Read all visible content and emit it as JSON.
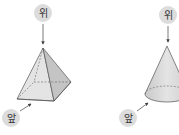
{
  "figures": [
    {
      "name": "square-pyramid",
      "top_label": "위",
      "front_label": "앞"
    },
    {
      "name": "cone",
      "top_label": "위",
      "front_label": "앞"
    }
  ],
  "colors": {
    "label_bg": "#dcdcdc",
    "face_light": "#e6e6e6",
    "face_mid": "#d2d2d2",
    "face_dark": "#bdbdbd",
    "stroke": "#555555"
  }
}
